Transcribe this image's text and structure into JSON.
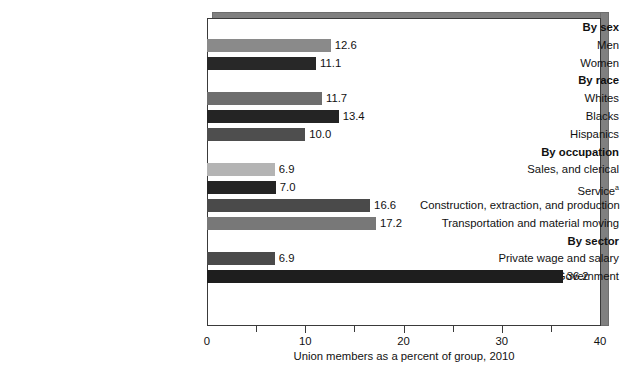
{
  "chart_data": {
    "type": "bar",
    "orientation": "horizontal",
    "title": "",
    "xlabel": "Union members as a percent of group, 2010",
    "ylabel": "",
    "xlim": [
      0,
      40
    ],
    "xticks": [
      0,
      10,
      20,
      30,
      40
    ],
    "xtick_labels": [
      "0",
      "10",
      "20",
      "30",
      "40"
    ],
    "minor_xticks": [
      5,
      15,
      25,
      35
    ],
    "grid": false,
    "legend": "none",
    "groups": [
      {
        "header": "By sex",
        "rows": [
          {
            "label": "Men",
            "value": 12.6,
            "value_label": "12.6",
            "color": "#8a8a8a"
          },
          {
            "label": "Women",
            "value": 11.1,
            "value_label": "11.1",
            "color": "#282828"
          }
        ]
      },
      {
        "header": "By race",
        "rows": [
          {
            "label": "Whites",
            "value": 11.7,
            "value_label": "11.7",
            "color": "#6e6e6e"
          },
          {
            "label": "Blacks",
            "value": 13.4,
            "value_label": "13.4",
            "color": "#242424"
          },
          {
            "label": "Hispanics",
            "value": 10.0,
            "value_label": "10.0",
            "color": "#4e4e4e"
          }
        ]
      },
      {
        "header": "By occupation",
        "rows": [
          {
            "label": "Sales, and clerical",
            "value": 6.9,
            "value_label": "6.9",
            "color": "#b4b4b4"
          },
          {
            "label": "Service",
            "label_superscript": "a",
            "value": 7.0,
            "value_label": "7.0",
            "color": "#242424"
          },
          {
            "label": "Construction, extraction, and production",
            "value": 16.6,
            "value_label": "16.6",
            "color": "#4a4a4a"
          },
          {
            "label": "Transportation and material moving",
            "value": 17.2,
            "value_label": "17.2",
            "color": "#787878"
          }
        ]
      },
      {
        "header": "By sector",
        "rows": [
          {
            "label": "Private wage and salary",
            "value": 6.9,
            "value_label": "6.9",
            "color": "#4a4a4a"
          },
          {
            "label": "Government",
            "value": 36.2,
            "value_label": "36.2",
            "color": "#1e1e1e"
          }
        ]
      }
    ]
  },
  "colors": {
    "frame": "#3a3a3a",
    "shadow": "#808080",
    "text": "#111111",
    "background": "#ffffff"
  }
}
